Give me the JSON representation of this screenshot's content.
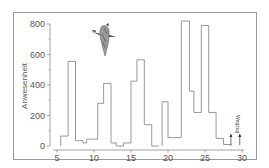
{
  "chart_data": {
    "type": "bar",
    "style": "step-histogram",
    "title": "",
    "xlabel": "",
    "ylabel": "Anwesenheit",
    "xlim": [
      4.5,
      30.5
    ],
    "ylim": [
      0,
      800
    ],
    "x_ticks": [
      5,
      10,
      15,
      20,
      25,
      30
    ],
    "y_ticks": [
      0,
      200,
      400,
      600,
      800
    ],
    "grid": false,
    "legend": null,
    "bins": [
      {
        "x0": 5.5,
        "x1": 6.5,
        "value": 65
      },
      {
        "x0": 6.5,
        "x1": 7.5,
        "value": 555
      },
      {
        "x0": 7.5,
        "x1": 8.5,
        "value": 35
      },
      {
        "x0": 8.5,
        "x1": 9.0,
        "value": 20
      },
      {
        "x0": 9.0,
        "x1": 9.5,
        "value": 45
      },
      {
        "x0": 9.5,
        "x1": 10.5,
        "value": 45
      },
      {
        "x0": 10.5,
        "x1": 11.3,
        "value": 280
      },
      {
        "x0": 11.3,
        "x1": 12.3,
        "value": 410
      },
      {
        "x0": 12.3,
        "x1": 13.0,
        "value": 20
      },
      {
        "x0": 13.0,
        "x1": 14.0,
        "value": 0
      },
      {
        "x0": 14.0,
        "x1": 15.0,
        "value": 20
      },
      {
        "x0": 15.0,
        "x1": 15.8,
        "value": 425
      },
      {
        "x0": 15.8,
        "x1": 16.8,
        "value": 565
      },
      {
        "x0": 16.8,
        "x1": 17.8,
        "value": 140
      },
      {
        "x0": 17.8,
        "x1": 18.8,
        "value": 0
      },
      {
        "x0": 19.2,
        "x1": 20.0,
        "value": 290
      },
      {
        "x0": 20.0,
        "x1": 21.8,
        "value": 55
      },
      {
        "x0": 21.8,
        "x1": 22.9,
        "value": 850
      },
      {
        "x0": 22.9,
        "x1": 23.5,
        "value": 360
      },
      {
        "x0": 23.5,
        "x1": 24.5,
        "value": 220
      },
      {
        "x0": 24.5,
        "x1": 25.5,
        "value": 790
      },
      {
        "x0": 25.5,
        "x1": 26.5,
        "value": 220
      },
      {
        "x0": 26.5,
        "x1": 27.5,
        "value": 50
      },
      {
        "x0": 27.5,
        "x1": 28.5,
        "value": 10
      }
    ],
    "annotations": [
      {
        "text": "Wegzug",
        "x": 29.0,
        "orientation": "vertical",
        "arrows_at": [
          28.5,
          29.7
        ]
      }
    ],
    "illustration": "flying-goose"
  }
}
